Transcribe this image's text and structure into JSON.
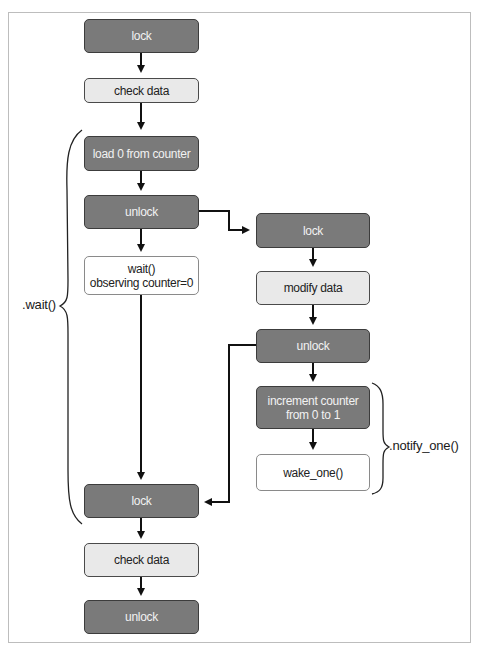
{
  "diagram": {
    "title": "",
    "left_column": {
      "nodes": [
        {
          "id": "lock1",
          "label": "lock",
          "style": "dark"
        },
        {
          "id": "check1",
          "label": "check data",
          "style": "light"
        },
        {
          "id": "load",
          "label": "load 0 from counter",
          "style": "dark"
        },
        {
          "id": "unlock1",
          "label": "unlock",
          "style": "dark"
        },
        {
          "id": "wait",
          "label_line1": "wait()",
          "label_line2": "observing counter=0",
          "style": "white"
        },
        {
          "id": "lock2",
          "label": "lock",
          "style": "dark"
        },
        {
          "id": "check2",
          "label": "check data",
          "style": "light"
        },
        {
          "id": "unlock2",
          "label": "unlock",
          "style": "dark"
        }
      ]
    },
    "right_column": {
      "nodes": [
        {
          "id": "lock_r",
          "label": "lock",
          "style": "dark"
        },
        {
          "id": "modify",
          "label": "modify data",
          "style": "light"
        },
        {
          "id": "unlock_r",
          "label": "unlock",
          "style": "dark"
        },
        {
          "id": "increment",
          "label_line1": "increment counter",
          "label_line2": "from 0 to 1",
          "style": "dark"
        },
        {
          "id": "wake",
          "label": "wake_one()",
          "style": "white"
        }
      ]
    },
    "braces": {
      "wait_label": ".wait()",
      "notify_label": ".notify_one()"
    },
    "edges": [
      [
        "lock1",
        "check1"
      ],
      [
        "check1",
        "load"
      ],
      [
        "load",
        "unlock1"
      ],
      [
        "unlock1",
        "wait"
      ],
      [
        "wait",
        "lock2"
      ],
      [
        "lock2",
        "check2"
      ],
      [
        "check2",
        "unlock2"
      ],
      [
        "unlock1",
        "lock_r"
      ],
      [
        "lock_r",
        "modify"
      ],
      [
        "modify",
        "unlock_r"
      ],
      [
        "unlock_r",
        "increment"
      ],
      [
        "increment",
        "wake"
      ],
      [
        "unlock_r",
        "lock2"
      ]
    ],
    "colors": {
      "dark_fill": "#7a7a7a",
      "light_fill": "#e9e9e9",
      "white_fill": "#ffffff",
      "line": "#111111"
    }
  }
}
